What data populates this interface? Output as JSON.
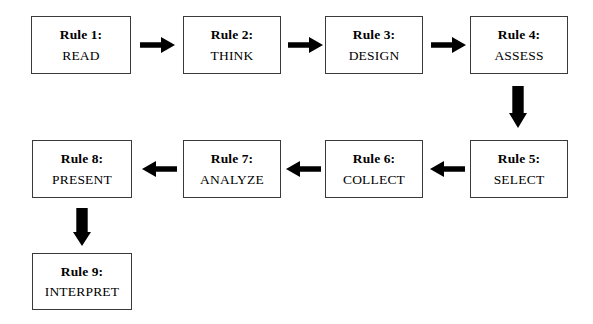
{
  "diagram": {
    "type": "flowchart",
    "orientation": "serpentine",
    "background_color": "#ffffff",
    "box_border_color": "#3a3a3a",
    "arrow_color": "#000000",
    "nodes": [
      {
        "id": "rule1",
        "title": "Rule 1:",
        "label": "READ",
        "row": 1,
        "col": 1
      },
      {
        "id": "rule2",
        "title": "Rule 2:",
        "label": "THINK",
        "row": 1,
        "col": 2
      },
      {
        "id": "rule3",
        "title": "Rule 3:",
        "label": "DESIGN",
        "row": 1,
        "col": 3
      },
      {
        "id": "rule4",
        "title": "Rule 4:",
        "label": "ASSESS",
        "row": 1,
        "col": 4
      },
      {
        "id": "rule5",
        "title": "Rule 5:",
        "label": "SELECT",
        "row": 2,
        "col": 4
      },
      {
        "id": "rule6",
        "title": "Rule 6:",
        "label": "COLLECT",
        "row": 2,
        "col": 3
      },
      {
        "id": "rule7",
        "title": "Rule 7:",
        "label": "ANALYZE",
        "row": 2,
        "col": 2
      },
      {
        "id": "rule8",
        "title": "Rule 8:",
        "label": "PRESENT",
        "row": 2,
        "col": 1
      },
      {
        "id": "rule9",
        "title": "Rule 9:",
        "label": "INTERPRET",
        "row": 3,
        "col": 1
      }
    ],
    "connectors": [
      {
        "id": "c1",
        "from": "rule1",
        "to": "rule2",
        "direction": "right"
      },
      {
        "id": "c2",
        "from": "rule2",
        "to": "rule3",
        "direction": "right"
      },
      {
        "id": "c3",
        "from": "rule3",
        "to": "rule4",
        "direction": "right"
      },
      {
        "id": "c4",
        "from": "rule4",
        "to": "rule5",
        "direction": "down"
      },
      {
        "id": "c5",
        "from": "rule5",
        "to": "rule6",
        "direction": "left"
      },
      {
        "id": "c6",
        "from": "rule6",
        "to": "rule7",
        "direction": "left"
      },
      {
        "id": "c7",
        "from": "rule7",
        "to": "rule8",
        "direction": "left"
      },
      {
        "id": "c8",
        "from": "rule8",
        "to": "rule9",
        "direction": "down"
      }
    ]
  }
}
